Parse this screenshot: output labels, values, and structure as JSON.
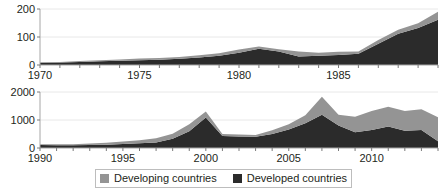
{
  "colors": {
    "developing": "#949494",
    "developed": "#2b2b2b",
    "axis": "#a6a6a6",
    "grid": "#e8e8e8",
    "text": "#231f20",
    "legend_border": "#bdbdbd",
    "background": "#ffffff"
  },
  "legend": {
    "position": "bottom-center",
    "entries": [
      {
        "label": "Developing countries",
        "color": "#949494",
        "swatch": "gray-square-swatch"
      },
      {
        "label": "Developed countries",
        "color": "#2b2b2b",
        "swatch": "black-square-swatch"
      }
    ]
  },
  "chart_data": [
    {
      "id": "top",
      "type": "area",
      "stacked": true,
      "title": "",
      "xlabel": "",
      "ylabel": "",
      "xlim": [
        1970,
        1990
      ],
      "ylim": [
        0,
        200
      ],
      "yticks": [
        0,
        100,
        200
      ],
      "ytick_labels": [
        "0",
        "100",
        "200"
      ],
      "xticks": [
        1970,
        1971,
        1972,
        1973,
        1974,
        1975,
        1976,
        1977,
        1978,
        1979,
        1980,
        1981,
        1982,
        1983,
        1984,
        1985,
        1986,
        1987,
        1988,
        1989,
        1990
      ],
      "xtick_labels_shown": [
        "1970",
        "1975",
        "1980",
        "1985"
      ],
      "xtick_labels_shown_at": [
        1970,
        1975,
        1980,
        1985
      ],
      "grid": true,
      "x": [
        1970,
        1971,
        1972,
        1973,
        1974,
        1975,
        1976,
        1977,
        1978,
        1979,
        1980,
        1981,
        1982,
        1983,
        1984,
        1985,
        1986,
        1987,
        1988,
        1989,
        1990
      ],
      "series": [
        {
          "name": "Developed countries",
          "color": "#2b2b2b",
          "values": [
            8,
            9,
            11,
            13,
            15,
            17,
            19,
            22,
            27,
            33,
            44,
            58,
            48,
            30,
            33,
            36,
            40,
            76,
            112,
            132,
            162
          ]
        },
        {
          "name": "Developing countries",
          "color": "#949494",
          "values": [
            2,
            2,
            3,
            4,
            5,
            6,
            6,
            7,
            8,
            9,
            11,
            8,
            8,
            18,
            11,
            11,
            8,
            13,
            14,
            17,
            28
          ]
        }
      ],
      "totals": [
        10,
        11,
        14,
        17,
        20,
        23,
        25,
        29,
        35,
        42,
        55,
        66,
        56,
        48,
        44,
        47,
        48,
        89,
        126,
        149,
        190
      ]
    },
    {
      "id": "bottom",
      "type": "area",
      "stacked": true,
      "title": "",
      "xlabel": "",
      "ylabel": "",
      "xlim": [
        1990,
        2014
      ],
      "ylim": [
        0,
        2000
      ],
      "yticks": [
        0,
        1000,
        2000
      ],
      "ytick_labels": [
        "0",
        "1000",
        "2000"
      ],
      "xticks": [
        1990,
        1991,
        1992,
        1993,
        1994,
        1995,
        1996,
        1997,
        1998,
        1999,
        2000,
        2001,
        2002,
        2003,
        2004,
        2005,
        2006,
        2007,
        2008,
        2009,
        2010,
        2011,
        2012,
        2013,
        2014
      ],
      "xtick_labels_shown": [
        "1990",
        "1995",
        "2000",
        "2005",
        "2010"
      ],
      "xtick_labels_shown_at": [
        1990,
        1995,
        2000,
        2005,
        2010
      ],
      "grid": true,
      "x": [
        1990,
        1991,
        1992,
        1993,
        1994,
        1995,
        1996,
        1997,
        1998,
        1999,
        2000,
        2001,
        2002,
        2003,
        2004,
        2005,
        2006,
        2007,
        2008,
        2009,
        2010,
        2011,
        2012,
        2013,
        2014
      ],
      "series": [
        {
          "name": "Developed countries",
          "color": "#2b2b2b",
          "values": [
            110,
            100,
            95,
            105,
            120,
            140,
            170,
            200,
            330,
            600,
            1090,
            430,
            410,
            400,
            500,
            660,
            880,
            1190,
            800,
            560,
            640,
            770,
            620,
            640,
            240
          ]
        },
        {
          "name": "Developing countries",
          "color": "#949494",
          "values": [
            25,
            30,
            40,
            55,
            70,
            90,
            110,
            150,
            180,
            250,
            210,
            70,
            70,
            60,
            130,
            190,
            290,
            640,
            390,
            560,
            680,
            700,
            700,
            740,
            860
          ]
        }
      ],
      "totals": [
        135,
        130,
        135,
        160,
        190,
        230,
        280,
        350,
        510,
        850,
        1300,
        500,
        480,
        460,
        630,
        850,
        1170,
        1830,
        1190,
        1120,
        1320,
        1470,
        1320,
        1380,
        1100
      ]
    }
  ]
}
